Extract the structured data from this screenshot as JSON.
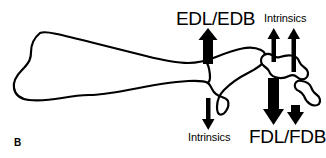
{
  "figure": {
    "panel_label": "B",
    "caption_alt": "Lateral view line drawing of foot bones with muscle force arrows",
    "background_color": "#ffffff",
    "ink_color": "#000000"
  },
  "labels": {
    "edl_edb": "EDL/EDB",
    "intrinsics_top": "Intrinsics",
    "intrinsics_bottom": "Intrinsics",
    "fdl_fdb": "FDL/FDB"
  },
  "arrows": [
    {
      "name": "edl-edb-arrow",
      "direction": "up",
      "weight": "thick",
      "label": "EDL/EDB"
    },
    {
      "name": "intrinsics-top-arrow-1",
      "direction": "up",
      "weight": "thin",
      "label": "Intrinsics"
    },
    {
      "name": "intrinsics-top-arrow-2",
      "direction": "up",
      "weight": "thin",
      "label": "Intrinsics"
    },
    {
      "name": "intrinsics-bottom-arrow",
      "direction": "down",
      "weight": "thin",
      "label": "Intrinsics"
    },
    {
      "name": "fdl-fdb-arrow-large",
      "direction": "down",
      "weight": "thick",
      "label": "FDL/FDB"
    },
    {
      "name": "fdl-fdb-arrow-small",
      "direction": "down",
      "weight": "thick",
      "label": "FDL/FDB"
    }
  ],
  "anatomy": [
    {
      "name": "calcaneus-metatarsal-outline"
    },
    {
      "name": "proximal-phalanx-outline"
    },
    {
      "name": "distal-phalanx-outline"
    }
  ]
}
